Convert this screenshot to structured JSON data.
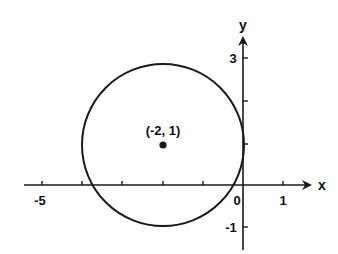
{
  "diagram": {
    "type": "circle-on-coordinate-plane",
    "axes": {
      "x_label": "x",
      "y_label": "y",
      "x_ticks": [
        -5,
        -4,
        -3,
        -2,
        -1,
        0,
        1
      ],
      "x_tick_labels": {
        "-5": "-5",
        "0": "0",
        "1": "1"
      },
      "y_ticks": [
        -1,
        1,
        2,
        3
      ],
      "y_tick_labels": {
        "3": "3",
        "-1": "-1"
      }
    },
    "circle": {
      "center": [
        -2,
        1
      ],
      "center_label": "(-2, 1)",
      "radius": 2
    },
    "colors": {
      "stroke": "#1a1a1a",
      "background": "#ffffff"
    }
  },
  "labels": {
    "x_axis": "x",
    "y_axis": "y",
    "tick_neg5": "-5",
    "tick_0": "0",
    "tick_1": "1",
    "tick_3": "3",
    "tick_neg1": "-1",
    "center": "(-2, 1)"
  }
}
